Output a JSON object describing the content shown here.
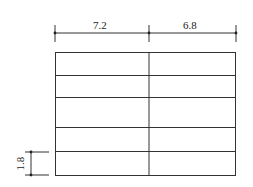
{
  "diagram": {
    "type": "floor-plan-grid",
    "columns": 2,
    "rows": 5,
    "dimensions": {
      "top_left_span": "7.2",
      "top_right_span": "6.8",
      "left_row_height": "1.8"
    },
    "line_color": "#333333"
  }
}
